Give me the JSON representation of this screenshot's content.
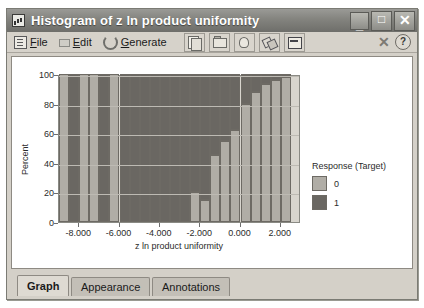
{
  "window": {
    "title": "Histogram of z ln product uniformity",
    "icon": "histogram-icon",
    "minimize_label": "_",
    "maximize_label": "□",
    "close_label": "✕"
  },
  "menu": {
    "items": [
      {
        "label": "File",
        "accel": "F",
        "icon": "file-icon"
      },
      {
        "label": "Edit",
        "accel": "E",
        "icon": "edit-icon"
      },
      {
        "label": "Generate",
        "accel": "G",
        "icon": "generate-icon"
      }
    ],
    "toolbar_icons": [
      "copy-icon",
      "export-image-icon",
      "print-preview-icon",
      "link-icon",
      "insert-chart-icon"
    ],
    "right_icons": [
      "close-small-icon",
      "help-icon"
    ],
    "close_small_label": "✕",
    "help_label": "?"
  },
  "tabs": [
    {
      "label": "Graph",
      "active": true
    },
    {
      "label": "Appearance",
      "active": false
    },
    {
      "label": "Annotations",
      "active": false
    }
  ],
  "legend": {
    "title": "Response (Target)",
    "entries": [
      {
        "label": "0",
        "color": "#b0ada6"
      },
      {
        "label": "1",
        "color": "#6a6762"
      }
    ]
  },
  "chart_data": {
    "type": "bar",
    "stacked": true,
    "title": "Histogram of z ln product uniformity",
    "xlabel": "z ln product uniformity",
    "ylabel": "Percent",
    "ylim": [
      0,
      100
    ],
    "yticks": [
      0,
      20,
      40,
      60,
      80,
      100
    ],
    "xlim": [
      -9.0,
      3.0
    ],
    "xticks": [
      -8.0,
      -6.0,
      -4.0,
      -2.0,
      0.0,
      2.0
    ],
    "xticklabels": [
      "-8.000",
      "-6.000",
      "-4.000",
      "-2.000",
      "0.000",
      "2.000"
    ],
    "grid": true,
    "legend_position": "right",
    "bin_width": 0.5,
    "bin_centers": [
      -8.75,
      -8.25,
      -7.75,
      -7.25,
      -6.75,
      -6.25,
      -5.75,
      -5.25,
      -4.75,
      -4.25,
      -3.75,
      -3.25,
      -2.75,
      -2.25,
      -1.75,
      -1.25,
      -0.75,
      -0.25,
      0.25,
      0.75,
      1.25,
      1.75,
      2.25
    ],
    "series": [
      {
        "name": "0",
        "color": "#b0ada6",
        "values": [
          100,
          0,
          100,
          100,
          0,
          100,
          0,
          0,
          0,
          0,
          0,
          0,
          0,
          20,
          15,
          45,
          55,
          62,
          80,
          88,
          93,
          96,
          98
        ]
      },
      {
        "name": "1",
        "color": "#6a6762",
        "values": [
          0,
          100,
          0,
          0,
          100,
          0,
          100,
          100,
          100,
          100,
          100,
          100,
          100,
          80,
          85,
          55,
          45,
          38,
          20,
          12,
          7,
          4,
          2
        ]
      }
    ]
  }
}
